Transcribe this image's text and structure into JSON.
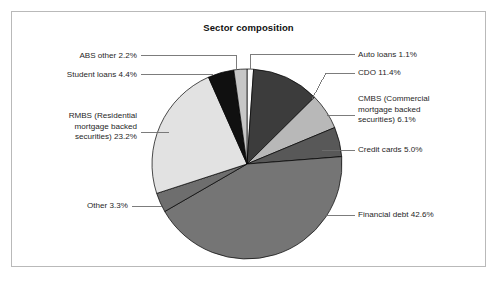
{
  "panel": {
    "title": "Sector composition",
    "border_color": "#b9b9b9",
    "background": "#ffffff"
  },
  "chart_data": {
    "type": "pie",
    "title": "Sector composition",
    "xlabel": "",
    "ylabel": "",
    "legend_position": "callout-labels",
    "grid": false,
    "start_angle_deg": 0,
    "direction": "clockwise",
    "units": "percent",
    "categories": [
      "Auto loans",
      "CDO",
      "CMBS (Commercial mortgage backed securities)",
      "Credit cards",
      "Financial debt",
      "Other",
      "RMBS (Residential mortgage backed securities)",
      "Student loans",
      "ABS other"
    ],
    "values": [
      1.1,
      11.4,
      6.1,
      5.0,
      42.6,
      3.3,
      23.2,
      4.4,
      2.2
    ],
    "colors": [
      "#fbfbfb",
      "#3c3c3c",
      "#b8b8b8",
      "#585858",
      "#757575",
      "#6e6e6e",
      "#e2e2e2",
      "#101010",
      "#c6c6c6"
    ],
    "slices": [
      {
        "label": "Auto loans",
        "value": 1.1,
        "display": "Auto loans 1.1%",
        "color": "#fbfbfb"
      },
      {
        "label": "CDO",
        "value": 11.4,
        "display": "CDO 11.4%",
        "color": "#3c3c3c"
      },
      {
        "label": "CMBS (Commercial mortgage backed securities)",
        "value": 6.1,
        "display": "CMBS (Commercial mortgage backed securities) 6.1%",
        "color": "#b8b8b8"
      },
      {
        "label": "Credit cards",
        "value": 5.0,
        "display": "Credit cards 5.0%",
        "color": "#585858"
      },
      {
        "label": "Financial debt",
        "value": 42.6,
        "display": "Financial debt 42.6%",
        "color": "#757575"
      },
      {
        "label": "Other",
        "value": 3.3,
        "display": "Other 3.3%",
        "color": "#6e6e6e"
      },
      {
        "label": "RMBS (Residential mortgage backed securities)",
        "value": 23.2,
        "display": "RMBS (Residential mortgage backed securities) 23.2%",
        "color": "#e2e2e2"
      },
      {
        "label": "Student loans",
        "value": 4.4,
        "display": "Student loans 4.4%",
        "color": "#101010"
      },
      {
        "label": "ABS other",
        "value": 2.2,
        "display": "ABS other 2.2%",
        "color": "#c6c6c6"
      }
    ]
  },
  "callouts": {
    "auto_loans": "Auto loans 1.1%",
    "cdo": "CDO 11.4%",
    "cmbs_line1": "CMBS (Commercial",
    "cmbs_line2": "mortgage backed",
    "cmbs_line3": "securities) 6.1%",
    "credit_cards": "Credit cards 5.0%",
    "financial_debt": "Financial debt 42.6%",
    "other": "Other 3.3%",
    "rmbs_line1": "RMBS (Residential",
    "rmbs_line2": "mortgage backed",
    "rmbs_line3": "securities) 23.2%",
    "student_loans": "Student loans 4.4%",
    "abs_other": "ABS other 2.2%"
  }
}
